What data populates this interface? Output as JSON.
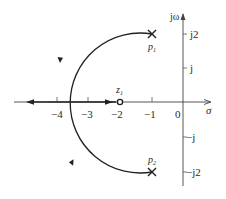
{
  "diagram": {
    "type": "root-locus",
    "axes": {
      "real_label": "σ",
      "imag_label": "jω",
      "origin_label": "0",
      "real_ticks": [
        {
          "value": -4,
          "label": "−4"
        },
        {
          "value": -3,
          "label": "−3"
        },
        {
          "value": -2,
          "label": "−2"
        },
        {
          "value": -1,
          "label": "−1"
        }
      ],
      "imag_ticks": [
        {
          "value": 2,
          "label": "j2"
        },
        {
          "value": 1,
          "label": "j"
        },
        {
          "value": -1,
          "label": "−j"
        },
        {
          "value": -2,
          "label": "−j2"
        }
      ]
    },
    "poles": [
      {
        "name": "p1",
        "label_main": "p",
        "label_sub": "1",
        "re": -1,
        "im": 2
      },
      {
        "name": "p2",
        "label_main": "p",
        "label_sub": "2",
        "re": -1,
        "im": -2
      }
    ],
    "zeros": [
      {
        "name": "z1",
        "label_main": "z",
        "label_sub": "1",
        "re": -2,
        "im": 0
      }
    ],
    "locus": {
      "circle_center": [
        -2,
        0
      ],
      "circle_radius": 2.236,
      "breakin_point": -4.236,
      "color": "#222222"
    }
  }
}
